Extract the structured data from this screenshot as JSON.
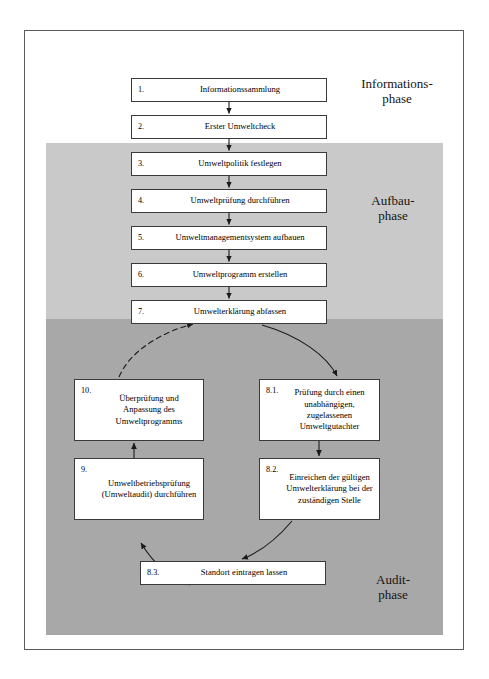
{
  "diagram": {
    "title_alt": "EMAS Ablaufschema",
    "boxes": [
      {
        "id": "1",
        "num": "1.",
        "label": "Informationssammlung"
      },
      {
        "id": "2",
        "num": "2.",
        "label": "Erster Umweltcheck"
      },
      {
        "id": "3",
        "num": "3.",
        "label": "Umweltpolitik festlegen"
      },
      {
        "id": "4",
        "num": "4.",
        "label": "Umweltprüfung durchführen"
      },
      {
        "id": "5",
        "num": "5.",
        "label": "Umweltmanagementsystem aufbauen"
      },
      {
        "id": "6",
        "num": "6.",
        "label": "Umweltprogramm erstellen"
      },
      {
        "id": "7",
        "num": "7.",
        "label": "Umwelterklärung abfassen"
      },
      {
        "id": "8.1",
        "num": "8.1.",
        "label": "Prüfung durch einen unabhängigen, zugelassenen Umweltgutachter"
      },
      {
        "id": "8.2",
        "num": "8.2.",
        "label": "Einreichen der gültigen Umwelterklärung bei der zuständigen Stelle"
      },
      {
        "id": "8.3",
        "num": "8.3.",
        "label": "Standort eintragen lassen"
      },
      {
        "id": "9",
        "num": "9.",
        "label": "Umweltbetriebsprüfung (Umweltaudit) durchführen"
      },
      {
        "id": "10",
        "num": "10.",
        "label": "Überprüfung und Anpassung des Umweltprogramms"
      }
    ],
    "phases": [
      {
        "id": "informations",
        "label": "Informations-\nphase",
        "shade": "#ffffff"
      },
      {
        "id": "aufbau",
        "label": "Aufbau-\nphase",
        "shade": "#c9c9c9"
      },
      {
        "id": "audit",
        "label": "Audit-\nphase",
        "shade": "#a8a8a8"
      }
    ],
    "colors": {
      "frame": "#5a5a5a",
      "box_border": "#3a3a3a",
      "arrow": "#1a1a1a",
      "band_light": "#c9c9c9",
      "band_dark": "#a8a8a8",
      "text": "#000000"
    }
  }
}
